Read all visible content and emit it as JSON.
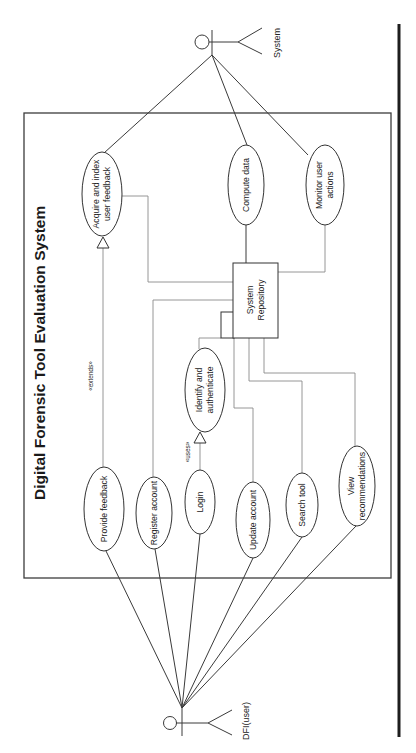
{
  "diagram": {
    "type": "uml-use-case",
    "orientation": "rotated-90-ccw",
    "title": "Digital Forensic Tool Evaluation System",
    "actors": [
      {
        "id": "system",
        "label": "System"
      },
      {
        "id": "user",
        "label": "DFI(user)"
      }
    ],
    "use_cases": {
      "acquire": {
        "line1": "Acquire and index",
        "line2": "user feedback"
      },
      "compute": {
        "line1": "Compute data"
      },
      "monitor": {
        "line1": "Monitor user",
        "line2": "actions"
      },
      "provide_feedback": {
        "line1": "Provide feedback"
      },
      "register": {
        "line1": "Register account"
      },
      "login": {
        "line1": "Login"
      },
      "identify": {
        "line1": "Identify and",
        "line2": "authenticate"
      },
      "update": {
        "line1": "Update account"
      },
      "search": {
        "line1": "Search tool"
      },
      "view_recs": {
        "line1": "View",
        "line2": "recommendations"
      }
    },
    "component": {
      "line1": "System",
      "line2": "Repository"
    },
    "relationships": {
      "extends_label": "«extends»",
      "uses_label": "«uses»"
    },
    "associations": [
      {
        "from": "system",
        "to": "acquire"
      },
      {
        "from": "system",
        "to": "compute"
      },
      {
        "from": "system",
        "to": "monitor"
      },
      {
        "from": "user",
        "to": "provide_feedback"
      },
      {
        "from": "user",
        "to": "register"
      },
      {
        "from": "user",
        "to": "login"
      },
      {
        "from": "user",
        "to": "update"
      },
      {
        "from": "user",
        "to": "search"
      },
      {
        "from": "user",
        "to": "view_recs"
      },
      {
        "from": "provide_feedback",
        "to": "acquire",
        "type": "extends"
      },
      {
        "from": "login",
        "to": "identify",
        "type": "uses"
      }
    ]
  }
}
